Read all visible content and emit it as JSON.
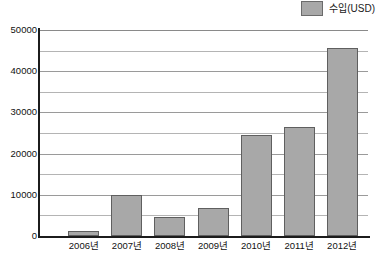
{
  "chart_data": {
    "type": "bar",
    "title": "",
    "subtitle": "",
    "xlabel": "",
    "ylabel": "",
    "categories": [
      "2006년",
      "2007년",
      "2008년",
      "2009년",
      "2010년",
      "2011년",
      "2012년"
    ],
    "values": [
      1300,
      10000,
      4600,
      6900,
      24600,
      26500,
      45600
    ],
    "series": [
      {
        "name": "수입(USD)",
        "values": [
          1300,
          10000,
          4600,
          6900,
          24600,
          26500,
          45600
        ]
      }
    ],
    "ylim": [
      0,
      50000
    ],
    "y_major_ticks": [
      0,
      10000,
      20000,
      30000,
      40000,
      50000
    ],
    "y_minor_ticks": [
      5000,
      15000,
      25000,
      35000,
      45000
    ],
    "y_tick_labels": [
      "0",
      "10000",
      "20000",
      "30000",
      "40000",
      "50000"
    ],
    "grid": true,
    "grid_orientation": "horizontal",
    "legend": {
      "position": "top-right",
      "entries": [
        {
          "label": "수입(USD)",
          "color": "#a8a8a8"
        }
      ]
    },
    "colors": {
      "bar_fill": "#a8a8a8",
      "bar_border": "#5f5f5f",
      "gridline": "#b4b4b4",
      "axis": "#1c1c1c",
      "background": "#ffffff",
      "text": "#111111"
    }
  }
}
